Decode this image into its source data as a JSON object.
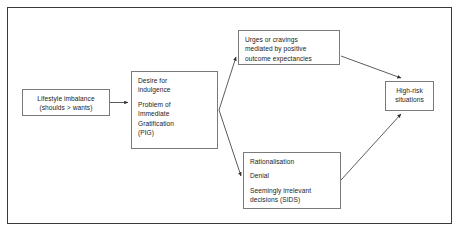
{
  "diagram": {
    "frame": {
      "style": "rectangular-border",
      "color": "#3a3a3a"
    },
    "nodes": {
      "lifestyle": {
        "name": "lifestyle-imbalance",
        "lines": [
          "Lifestyle imbalance",
          "(shoulds > wants)"
        ]
      },
      "pig": {
        "name": "desire-for-indulgence",
        "group_one": [
          "Desire for",
          "indulgence"
        ],
        "group_two": [
          "Problem of",
          "Immediate",
          "Gratification",
          "(PIG)"
        ]
      },
      "urges": {
        "name": "urges-or-cravings",
        "lines": [
          "Urges or cravings",
          "mediated by positive",
          "outcome expectancies"
        ]
      },
      "rationalisation": {
        "name": "rationalisation-denial-sids",
        "line_one": "Rationalisation",
        "line_two": "Denial",
        "group_three": [
          "Seemingly irrelevant",
          "decisions (SIDS)"
        ]
      },
      "highrisk": {
        "name": "high-risk-situations",
        "lines": [
          "High-risk",
          "situations"
        ]
      }
    },
    "connectors": [
      {
        "name": "lifestyle-to-pig",
        "from": "lifestyle",
        "to": "pig",
        "style": "straight-arrow"
      },
      {
        "name": "pig-to-urges",
        "from": "pig",
        "to": "urges",
        "style": "diagonal-arrow"
      },
      {
        "name": "pig-to-rationalisation",
        "from": "pig",
        "to": "rationalisation",
        "style": "diagonal-arrow"
      },
      {
        "name": "urges-to-highrisk",
        "from": "urges",
        "to": "highrisk",
        "style": "diagonal-arrow"
      },
      {
        "name": "rationalisation-to-highrisk",
        "from": "rationalisation",
        "to": "highrisk",
        "style": "diagonal-arrow"
      }
    ],
    "colors": {
      "background": "#ffffff",
      "frame_border": "#3a3a3a",
      "node_border": "#7a7a7a",
      "text": "#1c1c1c",
      "connector": "#4a4a4a"
    }
  }
}
